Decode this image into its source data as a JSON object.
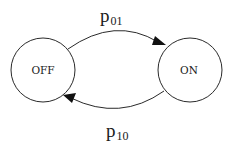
{
  "diagram": {
    "type": "state-transition",
    "states": [
      {
        "id": "off",
        "label": "OFF",
        "cx": 43,
        "cy": 70,
        "r": 32
      },
      {
        "id": "on",
        "label": "ON",
        "cx": 190,
        "cy": 70,
        "r": 32
      }
    ],
    "transitions": [
      {
        "id": "off-to-on",
        "from": "off",
        "to": "on",
        "label_main": "p",
        "label_sub": "01",
        "position": "top"
      },
      {
        "id": "on-to-off",
        "from": "on",
        "to": "off",
        "label_main": "p",
        "label_sub": "10",
        "position": "bottom"
      }
    ],
    "colors": {
      "stroke": "#2a2a2a",
      "text": "#1a1a1a",
      "background": "#ffffff"
    }
  }
}
